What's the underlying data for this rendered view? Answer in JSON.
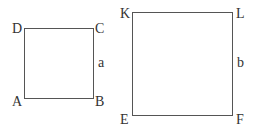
{
  "figure": {
    "small_square": {
      "vertices": {
        "top_left": "D",
        "top_right": "C",
        "bottom_right": "B",
        "bottom_left": "A"
      },
      "side_label": "a"
    },
    "large_square": {
      "vertices": {
        "top_left": "K",
        "top_right": "L",
        "bottom_right": "F",
        "bottom_left": "E"
      },
      "side_label": "b"
    }
  }
}
